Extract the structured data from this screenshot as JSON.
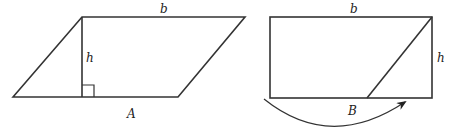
{
  "figure_left": {
    "title": "parallelogram",
    "labels": {
      "top_base": "b",
      "height": "h",
      "triangle": "A"
    },
    "vertices": {
      "bottom_left": [
        13,
        97
      ],
      "top_left": [
        82,
        17
      ],
      "top_right": [
        245,
        17
      ],
      "bottom_right": [
        178,
        97
      ]
    },
    "height_foot": [
      82,
      97
    ],
    "right_angle_size": 12
  },
  "figure_right": {
    "title": "rectangle",
    "labels": {
      "top_base": "b",
      "height": "h",
      "triangle": "B"
    },
    "vertices": {
      "top_left": [
        270,
        17
      ],
      "top_right": [
        432,
        17
      ],
      "bottom_right": [
        432,
        98
      ],
      "bottom_left": [
        270,
        98
      ]
    },
    "diagonal": {
      "from": [
        432,
        17
      ],
      "to": [
        367,
        98
      ]
    },
    "arrow": {
      "start": [
        264,
        99
      ],
      "control": [
        330,
        150
      ],
      "end": [
        405,
        102
      ]
    }
  },
  "colors": {
    "stroke": "#333333",
    "text": "#222222",
    "background": "#ffffff"
  }
}
